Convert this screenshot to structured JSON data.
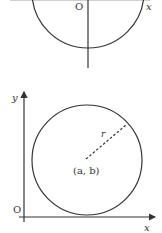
{
  "top_figure": {
    "origin_label": "O",
    "x_label": "x",
    "y_label": "y"
  },
  "bottom_figure": {
    "origin_label": "O",
    "x_label": "x",
    "y_label": "y",
    "radius_label": "r",
    "center_label": "(a, b)"
  },
  "colors": {
    "stroke": "#333333",
    "background": "#ffffff"
  }
}
